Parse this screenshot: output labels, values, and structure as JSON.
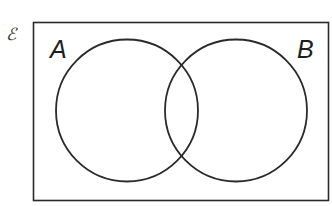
{
  "diagram": {
    "type": "venn",
    "universal_set": {
      "label": "ℰ"
    },
    "sets": [
      {
        "id": "A",
        "label": "A"
      },
      {
        "id": "B",
        "label": "B"
      }
    ],
    "colors": {
      "stroke": "#2a2a2a",
      "background": "#ffffff"
    }
  }
}
